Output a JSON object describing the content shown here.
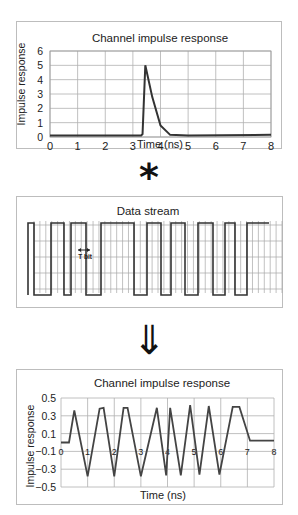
{
  "panels": [
    {
      "title": "Channel impulse response",
      "ylabel": "Impulse response",
      "xlabel": "Time (ns)",
      "yticks": [
        "0",
        "1",
        "2",
        "3",
        "4",
        "5",
        "6"
      ],
      "xticks": [
        "0",
        "1",
        "2",
        "3",
        "4",
        "5",
        "6",
        "7",
        "8"
      ]
    },
    {
      "title": "Data stream",
      "annotation": "T bit"
    },
    {
      "title": "Channel impulse response",
      "ylabel": "Impulse response",
      "xlabel": "Time (ns)",
      "yticks": [
        "0.5",
        "0.3",
        "0.1",
        "-0.1",
        "-0.3",
        "-0.5"
      ],
      "xticks": [
        "0",
        "1",
        "2",
        "3",
        "4",
        "5",
        "6",
        "7",
        "8"
      ]
    }
  ],
  "operators": {
    "convolution": "*",
    "result_arrow": "⇓"
  },
  "chart_data": [
    {
      "type": "line",
      "title": "Channel impulse response",
      "xlabel": "Time (ns)",
      "ylabel": "Impulse response",
      "xlim": [
        0,
        8
      ],
      "ylim": [
        0,
        6
      ],
      "grid": true,
      "x": [
        0,
        3.3,
        3.35,
        3.45,
        3.7,
        4.0,
        4.35,
        5,
        8
      ],
      "y": [
        0.1,
        0.1,
        0.2,
        5.0,
        2.8,
        0.8,
        0.15,
        0.1,
        0.15
      ]
    },
    {
      "type": "line",
      "title": "Data stream",
      "annotation": "T bit",
      "grid": true,
      "bits_high_low_segments": "square wave NRZ data pattern",
      "levels": [
        "high",
        "low"
      ]
    },
    {
      "type": "line",
      "title": "Channel impulse response",
      "xlabel": "Time (ns)",
      "ylabel": "Impulse response",
      "xlim": [
        0,
        8
      ],
      "ylim": [
        -0.5,
        0.5
      ],
      "grid": true,
      "x": [
        0,
        0.3,
        0.5,
        1.0,
        1.45,
        1.6,
        2.0,
        2.35,
        2.5,
        3.0,
        3.6,
        3.95,
        4.1,
        4.5,
        4.85,
        5.2,
        5.55,
        5.95,
        6.45,
        6.7,
        7.1,
        8
      ],
      "y": [
        0,
        0,
        0.36,
        -0.38,
        0.38,
        0.39,
        -0.38,
        0.39,
        0.39,
        -0.38,
        0.39,
        -0.37,
        0.39,
        -0.37,
        0.42,
        -0.36,
        0.41,
        -0.36,
        0.4,
        0.4,
        0.02,
        0.02
      ]
    }
  ]
}
